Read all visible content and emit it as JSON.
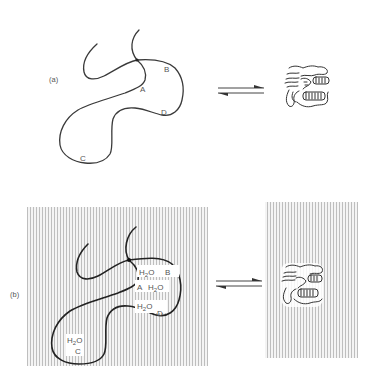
{
  "figure": {
    "panel_a": {
      "label": "(a)",
      "points": {
        "A": "A",
        "B": "B",
        "C": "C",
        "D": "D"
      }
    },
    "panel_b": {
      "label": "(b)",
      "points": {
        "A": "A",
        "B": "B",
        "C": "C",
        "D": "D"
      },
      "water": {
        "near_B": "H2O",
        "near_A": "H2O",
        "near_D": "H2O",
        "near_C": "H2O"
      }
    },
    "equilibrium_symbol": "⇌",
    "colors": {
      "line": "#333333",
      "hatch": "#bdbdbd",
      "background": "#ffffff"
    }
  }
}
